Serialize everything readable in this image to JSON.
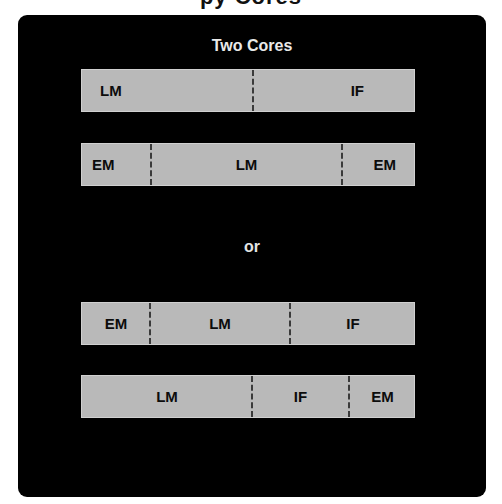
{
  "page": {
    "clipped_title_fragment": "py Cores"
  },
  "panel": {
    "title": "Two Cores",
    "separator_label": "or",
    "colors": {
      "panel_background": "#000000",
      "bar_fill": "#b9b9b9",
      "text_on_bar": "#0c0c0c",
      "divider": "#3a3a3a"
    }
  },
  "layouts": [
    {
      "segments": [
        {
          "label": "LM",
          "start": 0,
          "end": 171,
          "align": "left"
        },
        {
          "label": "IF",
          "start": 171,
          "end": 334,
          "align": "right"
        }
      ]
    },
    {
      "segments": [
        {
          "label": "EM",
          "start": 0,
          "end": 69,
          "align": "left"
        },
        {
          "label": "LM",
          "start": 69,
          "end": 260,
          "align": "center"
        },
        {
          "label": "EM",
          "start": 260,
          "end": 334,
          "align": "right"
        }
      ]
    },
    {
      "segments": [
        {
          "label": "EM",
          "start": 0,
          "end": 68,
          "align": "center"
        },
        {
          "label": "LM",
          "start": 68,
          "end": 208,
          "align": "center"
        },
        {
          "label": "IF",
          "start": 208,
          "end": 334,
          "align": "center"
        }
      ]
    },
    {
      "segments": [
        {
          "label": "LM",
          "start": 0,
          "end": 170,
          "align": "center"
        },
        {
          "label": "IF",
          "start": 170,
          "end": 267,
          "align": "center"
        },
        {
          "label": "EM",
          "start": 267,
          "end": 334,
          "align": "center"
        }
      ]
    }
  ]
}
